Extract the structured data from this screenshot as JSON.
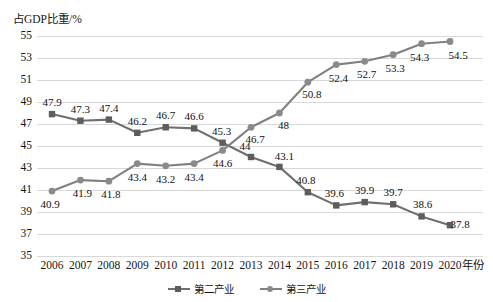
{
  "chart_data": {
    "type": "line",
    "title": "",
    "ylabel": "占GDP比重/%",
    "xlabel": "年份",
    "ylim": [
      35,
      55
    ],
    "ytick_step": 2,
    "yticks": [
      "55",
      "53",
      "51",
      "49",
      "47",
      "45",
      "43",
      "41",
      "39",
      "37",
      "35"
    ],
    "grid": true,
    "legend_position": "bottom-center",
    "categories": [
      "2006",
      "2007",
      "2008",
      "2009",
      "2010",
      "2011",
      "2012",
      "2013",
      "2014",
      "2015",
      "2016",
      "2017",
      "2018",
      "2019",
      "2020"
    ],
    "series": [
      {
        "name": "第二产业",
        "marker": "square",
        "color": "#6f6f6f",
        "values": [
          47.9,
          47.3,
          47.4,
          46.2,
          46.7,
          46.6,
          45.3,
          44,
          43.1,
          40.8,
          39.6,
          39.9,
          39.7,
          38.6,
          37.8
        ],
        "labels": [
          "47.9",
          "47.3",
          "47.4",
          "46.2",
          "46.7",
          "46.6",
          "45.3",
          "44",
          "43.1",
          "40.8",
          "39.6",
          "39.9",
          "39.7",
          "38.6",
          "37.8"
        ]
      },
      {
        "name": "第三产业",
        "marker": "circle",
        "color": "#808080",
        "values": [
          40.9,
          41.9,
          41.8,
          43.4,
          43.2,
          43.4,
          44.6,
          46.7,
          48,
          50.8,
          52.4,
          52.7,
          53.3,
          54.3,
          54.5
        ],
        "labels": [
          "40.9",
          "41.9",
          "41.8",
          "43.4",
          "43.2",
          "43.4",
          "44.6",
          "46.7",
          "48",
          "50.8",
          "52.4",
          "52.7",
          "53.3",
          "54.3",
          "54.5"
        ]
      }
    ]
  },
  "legend": {
    "items": [
      {
        "label": "第二产业"
      },
      {
        "label": "第三产业"
      }
    ]
  },
  "colors": {
    "series_secondary": "#6f6f6f",
    "series_tertiary": "#808080",
    "gridline": "#d8d8d8",
    "text": "#161616"
  }
}
